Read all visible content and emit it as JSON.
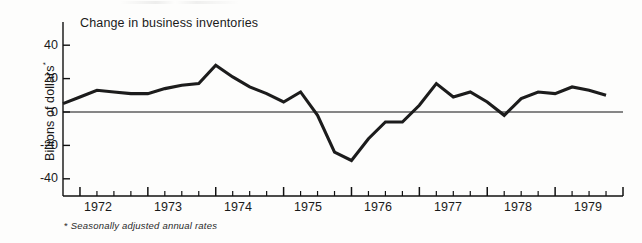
{
  "figure": {
    "plot_title": "Change in business inventories",
    "y_axis_caption": "Billions of dollars",
    "y_axis_caption_marker": "*",
    "footnote_marker": "*",
    "footnote": "Seasonally adjusted annual rates",
    "line_color": "#1c1c1c",
    "axis_color": "#111111",
    "background_color": "#fdfdfc"
  },
  "chart_data": {
    "type": "line",
    "title": "Change in business inventories",
    "xlabel": "",
    "ylabel": "Billions of dollars*",
    "ylim": [
      -52,
      48
    ],
    "xlim": [
      1971.75,
      1980.0
    ],
    "grid": false,
    "legend": null,
    "y_ticks": [
      40,
      20,
      0,
      -20,
      -40
    ],
    "y_tick_labels": [
      "40",
      "20",
      "0",
      "-20",
      "-40"
    ],
    "x_tick_labels": [
      "1972",
      "1973",
      "1974",
      "1975",
      "1976",
      "1977",
      "1978",
      "1979"
    ],
    "x_major_ticks": [
      1972.0,
      1973.0,
      1974.0,
      1975.0,
      1976.0,
      1977.0,
      1978.0,
      1979.0,
      1980.0
    ],
    "x_minor_ticks_per_year": 4,
    "zero_line": true,
    "series": [
      {
        "name": "Change in business inventories",
        "x": [
          1971.75,
          1972.0,
          1972.25,
          1972.5,
          1972.75,
          1973.0,
          1973.25,
          1973.5,
          1973.75,
          1974.0,
          1974.25,
          1974.5,
          1974.75,
          1975.0,
          1975.25,
          1975.5,
          1975.75,
          1976.0,
          1976.25,
          1976.5,
          1976.75,
          1977.0,
          1977.25,
          1977.5,
          1977.75,
          1978.0,
          1978.25,
          1978.5,
          1978.75,
          1979.0,
          1979.25,
          1979.5,
          1979.75
        ],
        "values": [
          5,
          9,
          13,
          12,
          11,
          11,
          14,
          16,
          17,
          28,
          21,
          15,
          11,
          6,
          12,
          -2,
          -24,
          -29,
          -16,
          -6,
          -6,
          4,
          17,
          9,
          12,
          6,
          -2,
          8,
          12,
          11,
          15,
          13,
          10
        ]
      }
    ]
  }
}
